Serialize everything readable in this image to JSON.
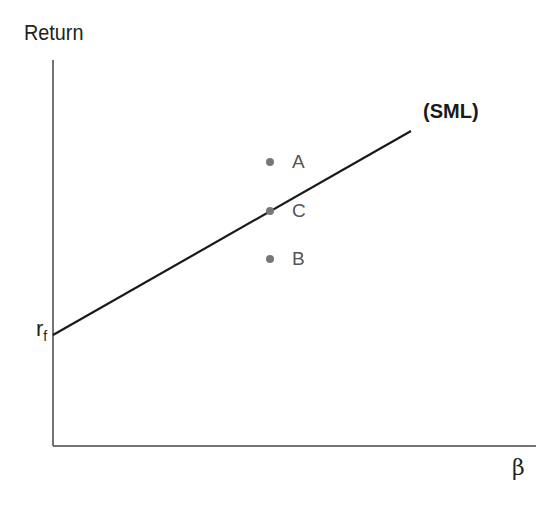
{
  "diagram": {
    "y_axis_label": "Return",
    "x_axis_label": "β",
    "intercept_label": "r",
    "intercept_subscript": "f",
    "line_label": "(SML)",
    "points": [
      {
        "label": "A",
        "position": "above line"
      },
      {
        "label": "C",
        "position": "on line"
      },
      {
        "label": "B",
        "position": "below line"
      }
    ],
    "colors": {
      "line": "#1a1a1a",
      "axis": "#444444",
      "point": "#777777"
    }
  }
}
